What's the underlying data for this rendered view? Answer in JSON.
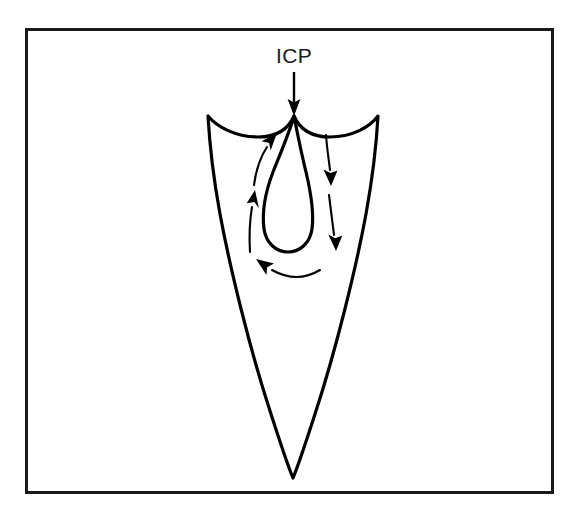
{
  "figure": {
    "background_color": "#ffffff",
    "ink_color": "#000000",
    "frame": {
      "stroke_color": "#1a1a1a",
      "x": 25,
      "y": 28,
      "width": 528,
      "height": 465
    },
    "labels": [
      {
        "id": "icp-label",
        "text": "ICP",
        "x": 294,
        "y": 63,
        "font_size": 21
      }
    ],
    "pointer": {
      "id": "icp-pointer-arrow",
      "direction": "down",
      "from_x": 294,
      "from_y": 72,
      "to_x": 294,
      "to_y": 114
    },
    "plasma_body": {
      "id": "plasma-outline",
      "apex_x": 294,
      "apex_y": 116,
      "top_left_x": 208,
      "top_left_y": 116,
      "top_right_x": 378,
      "top_right_y": 116,
      "tip_x": 293,
      "tip_y": 478,
      "widest_left_x": 206,
      "widest_right_x": 380
    },
    "central_channel": {
      "id": "central-channel-outline",
      "top_x": 294,
      "top_y": 116,
      "left_x": 264,
      "right_x": 312,
      "bottom_y": 252
    },
    "flow_arrows": [
      {
        "id": "flow-arrow-right-upper",
        "side": "right",
        "direction": "down",
        "order": 1
      },
      {
        "id": "flow-arrow-right-lower",
        "side": "right",
        "direction": "down",
        "order": 2
      },
      {
        "id": "flow-arrow-bottom-sweep",
        "side": "bottom",
        "direction": "left",
        "order": 3
      },
      {
        "id": "flow-arrow-left-lower",
        "side": "left",
        "direction": "up",
        "order": 4
      },
      {
        "id": "flow-arrow-left-upper",
        "side": "left",
        "direction": "up",
        "order": 5
      }
    ],
    "flow_description": "Recirculating toroidal flow: gas descends along the right of the central channel, sweeps left across the bottom, and rises along the left back toward the apex."
  }
}
